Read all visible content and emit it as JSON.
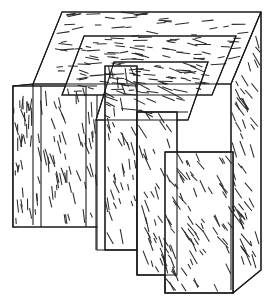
{
  "figure": {
    "kind": "line-art-illustration",
    "canvas": {
      "width": 269,
      "height": 307,
      "background": "#ffffff"
    },
    "colors": {
      "background": "#ffffff",
      "outline": "#1a1a1a",
      "secondary_outline": "#7a7a7a",
      "hatch": "#2b2b2b",
      "hatch_soft": "#4a4a4a"
    },
    "faces": [
      {
        "id": "top-face-outer",
        "name": "outer-top-face",
        "hatch_angle_deg": 0,
        "hatch_density": 0.55,
        "points": "33,84 62,12 261,12 231,84"
      },
      {
        "id": "left-face-outer",
        "name": "outer-left-face",
        "hatch_angle_deg": 90,
        "hatch_density": 0.8,
        "points": "13,86 33,84 33,225 13,227"
      },
      {
        "id": "right-face-outer",
        "name": "outer-right-face",
        "hatch_angle_deg": 62,
        "hatch_density": 0.8,
        "points": "231,84 261,12 261,270 231,290"
      },
      {
        "id": "front-face-outer",
        "name": "outer-front-face",
        "hatch_angle_deg": 78,
        "hatch_density": 0.75,
        "points": "13,86 97,86 97,227 13,227"
      },
      {
        "id": "top-face-step2",
        "name": "step-2-top-face",
        "hatch_angle_deg": 8,
        "hatch_density": 0.6,
        "points": "62,95 84,36 236,36 212,95"
      },
      {
        "id": "top-face-step3",
        "name": "step-3-top-face",
        "hatch_angle_deg": 18,
        "hatch_density": 0.65,
        "points": "96,120 114,62 208,62 188,120"
      },
      {
        "id": "front-slab-2",
        "name": "slab-2-front-face",
        "hatch_angle_deg": 72,
        "hatch_density": 0.8,
        "points": "105,66 137,66 137,250 105,250"
      },
      {
        "id": "front-slab-3",
        "name": "slab-3-front-face",
        "hatch_angle_deg": 66,
        "hatch_density": 0.8,
        "points": "137,112 177,112 177,275 137,275"
      },
      {
        "id": "front-slab-4",
        "name": "slab-4-front-face",
        "hatch_angle_deg": 58,
        "hatch_density": 0.85,
        "points": "165,152 233,152 233,293 165,293"
      }
    ],
    "edges": [
      {
        "name": "outer-silhouette",
        "d": "M13,86 L33,84 L62,12 L261,12 L261,270 L233,293 L165,293 L165,275 L137,275 L137,250 L97,250 L97,227 L13,227 Z"
      },
      {
        "name": "outer-top-front-edge",
        "d": "M33,84 L231,84"
      },
      {
        "name": "outer-top-right-edge",
        "d": "M231,84 L261,12"
      },
      {
        "name": "outer-left-vertical-edge",
        "d": "M33,84 L33,225"
      },
      {
        "name": "outer-right-inner-vertical",
        "d": "M231,84 L231,290"
      },
      {
        "name": "step2-top-outline",
        "d": "M62,95 L84,36 L236,36 L212,95 Z"
      },
      {
        "name": "step3-top-outline",
        "d": "M96,120 L114,62 L208,62 L188,120 Z"
      },
      {
        "name": "slab2-outline",
        "d": "M105,66 L137,66 L137,250 L105,250 Z"
      },
      {
        "name": "slab3-outline",
        "d": "M137,112 L177,112 L177,275 L137,275 Z"
      },
      {
        "name": "slab4-outline",
        "d": "M165,152 L233,152 L233,293 L165,293 Z"
      },
      {
        "name": "front-face-divider-left",
        "d": "M41,86 L41,227"
      },
      {
        "name": "front-face-divider-right",
        "d": "M86,86 L86,227"
      },
      {
        "name": "front-face-top-edge",
        "d": "M13,86 L97,86"
      },
      {
        "name": "inner-notch-left",
        "d": "M96,120 L96,250"
      },
      {
        "name": "inner-notch-mid",
        "d": "M137,112 L188,112"
      },
      {
        "name": "inner-notch-low",
        "d": "M165,152 L231,152"
      }
    ]
  }
}
